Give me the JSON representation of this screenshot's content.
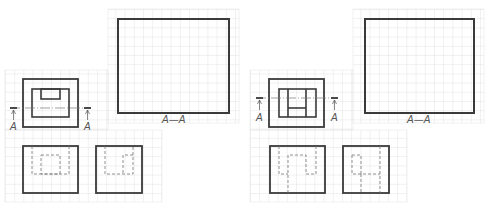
{
  "figures": [
    {
      "id": "left",
      "offset_x": 0,
      "top_view": {
        "cut_label_left": "A",
        "cut_label_right": "A"
      },
      "section_view": {
        "label": "A—A"
      },
      "variant": "notch"
    },
    {
      "id": "right",
      "offset_x": 245,
      "top_view": {
        "cut_label_left": "A",
        "cut_label_right": "A"
      },
      "section_view": {
        "label": "A—A"
      },
      "variant": "h-slot"
    }
  ],
  "colors": {
    "grid": "#dcdcdc",
    "line": "#3a3a3a",
    "hidden": "#777777",
    "text": "#555555"
  }
}
